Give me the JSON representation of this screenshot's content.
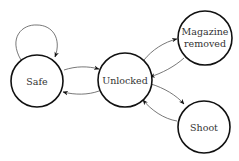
{
  "diagram": {
    "type": "state-diagram",
    "nodes": [
      {
        "id": "safe",
        "label": "Safe",
        "cx": 37,
        "cy": 81,
        "r": 26
      },
      {
        "id": "unlocked",
        "label": "Unlocked",
        "cx": 125,
        "cy": 80,
        "r": 27
      },
      {
        "id": "magazine",
        "label_line1": "Magazine",
        "label_line2": "removed",
        "cx": 205,
        "cy": 38,
        "r": 27
      },
      {
        "id": "shoot",
        "label": "Shoot",
        "cx": 204,
        "cy": 127,
        "r": 26
      }
    ],
    "edges": [
      {
        "from": "safe",
        "to": "safe"
      },
      {
        "from": "safe",
        "to": "unlocked"
      },
      {
        "from": "unlocked",
        "to": "safe"
      },
      {
        "from": "unlocked",
        "to": "magazine"
      },
      {
        "from": "magazine",
        "to": "unlocked"
      },
      {
        "from": "unlocked",
        "to": "shoot"
      },
      {
        "from": "shoot",
        "to": "unlocked"
      }
    ]
  }
}
